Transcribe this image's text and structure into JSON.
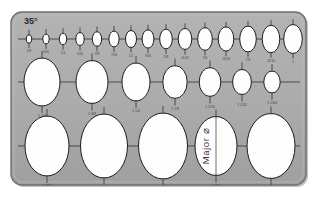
{
  "canvas": {
    "width": 317,
    "height": 197,
    "background": "#ffffff"
  },
  "template": {
    "kind": "ellipse-drafting-template",
    "angle_label": "35°",
    "major_axis_label": "Major ⌀",
    "body_color": "#ababab",
    "body_edge_color": "#6f6f6f",
    "hole_fill": "#fdfdfd",
    "hole_stroke": "#1d1d1d",
    "axis_line_color": "#4a4a4a",
    "frame": {
      "x": 11,
      "y": 12,
      "width": 295,
      "height": 173,
      "radius": 11
    }
  },
  "rows": [
    {
      "name": "small-row",
      "axis_y": 39,
      "axis_x_start": 18,
      "axis_x_end": 300,
      "ellipses": [
        {
          "cx": 29,
          "rx": 2.7,
          "ry": 4.2,
          "label": "1/8"
        },
        {
          "cx": 46,
          "rx": 3.2,
          "ry": 5.0,
          "label": "3/16"
        },
        {
          "cx": 63,
          "rx": 3.7,
          "ry": 5.8,
          "label": "1/4"
        },
        {
          "cx": 80,
          "rx": 4.2,
          "ry": 6.6,
          "label": "5/16"
        },
        {
          "cx": 97,
          "rx": 4.7,
          "ry": 7.4,
          "label": "3/8"
        },
        {
          "cx": 114,
          "rx": 5.1,
          "ry": 8.0,
          "label": "7/16"
        },
        {
          "cx": 131,
          "rx": 5.5,
          "ry": 8.6,
          "label": "1/2"
        },
        {
          "cx": 148,
          "rx": 5.9,
          "ry": 9.2,
          "label": "9/16"
        },
        {
          "cx": 166,
          "rx": 6.3,
          "ry": 9.9,
          "label": "5/8"
        },
        {
          "cx": 185,
          "rx": 6.8,
          "ry": 10.6,
          "label": "11/16"
        },
        {
          "cx": 205,
          "rx": 7.3,
          "ry": 11.4,
          "label": "3/4"
        },
        {
          "cx": 226,
          "rx": 7.8,
          "ry": 12.2,
          "label": "13/16"
        },
        {
          "cx": 248,
          "rx": 8.3,
          "ry": 13.0,
          "label": "7/8"
        },
        {
          "cx": 271,
          "rx": 8.8,
          "ry": 13.8,
          "label": "15/16"
        },
        {
          "cx": 293,
          "rx": 9.3,
          "ry": 14.6,
          "label": "1"
        }
      ]
    },
    {
      "name": "medium-row",
      "axis_y": 82,
      "axis_x_start": 18,
      "axis_x_end": 300,
      "ellipses": [
        {
          "cx": 42,
          "rx": 18.0,
          "ry": 24.0,
          "label": "1 1/2"
        },
        {
          "cx": 92,
          "rx": 16.0,
          "ry": 21.5,
          "label": "1 3/8"
        },
        {
          "cx": 136,
          "rx": 14.0,
          "ry": 19.0,
          "label": "1 1/4"
        },
        {
          "cx": 175,
          "rx": 12.2,
          "ry": 16.5,
          "label": "1 1/8"
        },
        {
          "cx": 210,
          "rx": 10.8,
          "ry": 14.5,
          "label": "1 1/16"
        },
        {
          "cx": 242,
          "rx": 9.4,
          "ry": 12.6,
          "label": "1 1/32"
        },
        {
          "cx": 272,
          "rx": 8.2,
          "ry": 11.0,
          "label": "1 1/64"
        }
      ]
    },
    {
      "name": "large-row",
      "axis_y": 146,
      "axis_x_start": 18,
      "axis_x_end": 300,
      "ellipses": [
        {
          "cx": 47,
          "rx": 22.0,
          "ry": 30.0,
          "label": "1 7/8"
        },
        {
          "cx": 104,
          "rx": 23.5,
          "ry": 32.0,
          "label": "2"
        },
        {
          "cx": 163,
          "rx": 24.5,
          "ry": 33.0,
          "label": "2 1/8"
        },
        {
          "cx": 216,
          "rx": 21.0,
          "ry": 29.5,
          "label": "2 1/4",
          "has_major_label": true
        },
        {
          "cx": 271,
          "rx": 24.0,
          "ry": 32.5,
          "label": "2 1/2"
        }
      ]
    }
  ]
}
